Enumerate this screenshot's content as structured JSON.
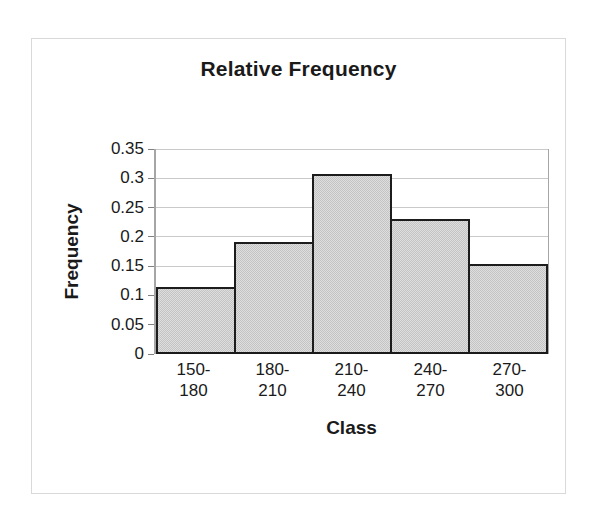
{
  "chart_data": {
    "type": "bar",
    "title": "Relative Frequency",
    "xlabel": "Class",
    "ylabel": "Frequency",
    "categories": [
      "150-180",
      "180-210",
      "210-240",
      "240-270",
      "270-300"
    ],
    "category_lines": [
      [
        "150-",
        "180"
      ],
      [
        "180-",
        "210"
      ],
      [
        "210-",
        "240"
      ],
      [
        "240-",
        "270"
      ],
      [
        "270-",
        "300"
      ]
    ],
    "values": [
      0.115,
      0.193,
      0.308,
      0.232,
      0.154
    ],
    "ylim": [
      0,
      0.35
    ],
    "ytick_step": 0.05,
    "yticks": [
      0.35,
      0.3,
      0.25,
      0.2,
      0.15,
      0.1,
      0.05,
      0
    ],
    "ytick_labels": [
      "0.35",
      "0.3",
      "0.25",
      "0.2",
      "0.15",
      "0.1",
      "0.05",
      "0"
    ],
    "grid": true,
    "legend": false,
    "bar_gap": 0,
    "colors": {
      "bar_fill": "#c3c3c3",
      "bar_border": "#1c1c1c",
      "gridline": "#c9c9c9",
      "axis": "#808080",
      "baseline": "#1a1a1a",
      "text": "#1a1a1a",
      "frame_border": "#d9d9d9",
      "background": "#ffffff"
    }
  }
}
